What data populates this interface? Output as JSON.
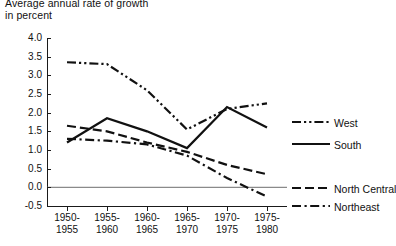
{
  "title": {
    "line1": "Average annual rate of growth",
    "line2": "in percent"
  },
  "chart_data": {
    "type": "line",
    "title": "Average annual rate of growth in percent",
    "xlabel": "",
    "ylabel": "",
    "ylim": [
      -0.5,
      4.0
    ],
    "ytick_step": 0.5,
    "grid": false,
    "zero_line": true,
    "legend_position": "right-inline",
    "categories": [
      "1950-\n1955",
      "1955-\n1960",
      "1960-\n1965",
      "1965-\n1970",
      "1970-\n1975",
      "1975-\n1980"
    ],
    "category_lines": [
      [
        "1950-",
        "1955"
      ],
      [
        "1955-",
        "1960"
      ],
      [
        "1960-",
        "1965"
      ],
      [
        "1965-",
        "1970"
      ],
      [
        "1970-",
        "1975"
      ],
      [
        "1975-",
        "1980"
      ]
    ],
    "ytick_labels": [
      "4.0",
      "3.5",
      "3.0",
      "2.5",
      "2.0",
      "1.5",
      "1.0",
      "0.5",
      "0.0",
      "-0.5"
    ],
    "ytick_values": [
      4.0,
      3.5,
      3.0,
      2.5,
      2.0,
      1.5,
      1.0,
      0.5,
      0.0,
      -0.5
    ],
    "series": [
      {
        "name": "West",
        "style": "dash-dot-dot",
        "values": [
          3.35,
          3.3,
          2.6,
          1.55,
          2.1,
          2.25
        ]
      },
      {
        "name": "South",
        "style": "solid",
        "values": [
          1.2,
          1.85,
          1.5,
          1.05,
          2.15,
          1.6
        ]
      },
      {
        "name": "North Central",
        "style": "dashed",
        "values": [
          1.65,
          1.5,
          1.2,
          0.95,
          0.6,
          0.35
        ]
      },
      {
        "name": "Northeast",
        "style": "dash-dot",
        "values": [
          1.3,
          1.25,
          1.15,
          0.85,
          0.25,
          -0.25
        ]
      }
    ]
  },
  "legend": [
    {
      "label": "West"
    },
    {
      "label": "South"
    },
    {
      "label": "North Central"
    },
    {
      "label": "Northeast"
    }
  ]
}
